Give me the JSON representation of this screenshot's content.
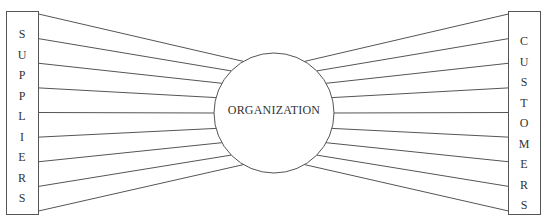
{
  "left_box": {
    "label": "SUPPLIERS",
    "letters": [
      "S",
      "U",
      "P",
      "P",
      "L",
      "I",
      "E",
      "R",
      "S"
    ]
  },
  "right_box": {
    "label": "CUSTOMERS",
    "letters": [
      "C",
      "U",
      "S",
      "T",
      "O",
      "M",
      "E",
      "R",
      "S"
    ]
  },
  "center": {
    "label": "ORGANIZATION"
  },
  "connections": {
    "left_count": 9,
    "right_count": 9
  },
  "colors": {
    "stroke": "#555555",
    "text": "#333333",
    "background": "#ffffff"
  }
}
